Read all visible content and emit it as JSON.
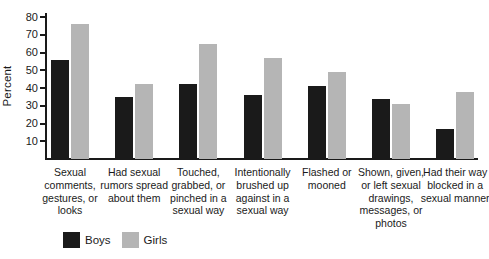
{
  "chart_data": {
    "type": "bar",
    "title": "",
    "xlabel": "",
    "ylabel": "Percent",
    "ylim": [
      0,
      80
    ],
    "yticks": [
      10,
      20,
      30,
      40,
      50,
      60,
      70,
      80
    ],
    "grid": false,
    "legend_position": "bottom-left",
    "categories": [
      "Sexual comments, gestures, or looks",
      "Had sexual rumors spread about them",
      "Touched, grabbed, or pinched in a sexual way",
      "Intentionally brushed up against in a sexual way",
      "Flashed or mooned",
      "Shown, given, or left sexual drawings, messages, or photos",
      "Had their way blocked in a sexual manner"
    ],
    "series": [
      {
        "name": "Boys",
        "color": "#1a1a1a",
        "values": [
          56,
          35,
          42,
          36,
          41,
          34,
          17
        ]
      },
      {
        "name": "Girls",
        "color": "#b5b5b5",
        "values": [
          76,
          42,
          65,
          57,
          49,
          31,
          38
        ]
      }
    ]
  },
  "colors": {
    "axis": "#1a1a1a",
    "text": "#1a1a1a",
    "background": "#ffffff"
  }
}
